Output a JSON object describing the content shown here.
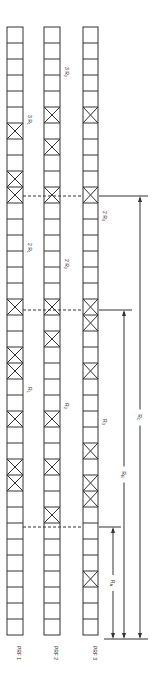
{
  "columns": [
    {
      "id": "prf1",
      "label": "PRF 1",
      "x": 7,
      "width": 16,
      "marked_cells": [
        6,
        9,
        10,
        17,
        20,
        21,
        24,
        27,
        28
      ],
      "labels": [
        {
          "text": "3 R",
          "sub": "1",
          "cell": 5
        },
        {
          "text": "2 R",
          "sub": "1",
          "cell": 13
        },
        {
          "text": "R",
          "sub": "1",
          "cell": 22
        }
      ]
    },
    {
      "id": "prf2",
      "label": "PRF 2",
      "x": 44,
      "width": 16,
      "marked_cells": [
        5,
        7,
        10,
        17,
        19,
        24,
        27,
        30
      ],
      "labels": [
        {
          "text": "3 R",
          "sub": "2",
          "cell": 2
        },
        {
          "text": "2 R",
          "sub": "2",
          "cell": 14
        },
        {
          "text": "R",
          "sub": "2",
          "cell": 23
        }
      ]
    },
    {
      "id": "prf3",
      "label": "PRF 3",
      "x": 83,
      "width": 15,
      "marked_cells": [
        5,
        10,
        17,
        18,
        21,
        26,
        28,
        29,
        34
      ],
      "labels": [
        {
          "text": "2 R",
          "sub": "3",
          "cell": 11
        },
        {
          "text": "R",
          "sub": "3",
          "cell": 24
        }
      ]
    }
  ],
  "grid": {
    "top": 27,
    "cell_height": 16,
    "cell_count": 38
  },
  "dashed_lines": [
    {
      "y": 196,
      "from_col": "prf1",
      "to_col": "prf3"
    },
    {
      "y": 310,
      "from_col": "prf1",
      "to_col": "prf3"
    },
    {
      "y": 527,
      "from_col": "prf1",
      "to_col": "prf3"
    }
  ],
  "dimensions": [
    {
      "id": "ra",
      "label": "R",
      "sub": "A",
      "x": 113,
      "top": 527,
      "bottom": 639
    },
    {
      "id": "rb",
      "label": "R",
      "sub": "B",
      "x": 124,
      "top": 310,
      "bottom": 639
    },
    {
      "id": "rc",
      "label": "R",
      "sub": "C",
      "x": 140,
      "top": 196,
      "bottom": 639
    }
  ],
  "baseline_y": 639,
  "colors": {
    "line": "#333333",
    "background": "#ffffff"
  }
}
